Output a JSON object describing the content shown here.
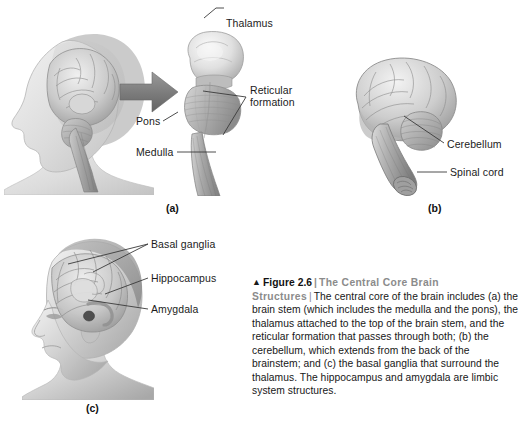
{
  "figure": {
    "panels": [
      {
        "id": "a",
        "letter": "(a)",
        "name": "head-with-brainstem-panel",
        "labels": [
          {
            "name": "thalamus",
            "text": "Thalamus"
          },
          {
            "name": "reticular-formation",
            "text": "Reticular\nformation"
          },
          {
            "name": "pons",
            "text": "Pons"
          },
          {
            "name": "medulla",
            "text": "Medulla"
          }
        ]
      },
      {
        "id": "b",
        "letter": "(b)",
        "name": "brain-with-cerebellum-panel",
        "labels": [
          {
            "name": "cerebellum",
            "text": "Cerebellum"
          },
          {
            "name": "spinal-cord",
            "text": "Spinal cord"
          }
        ]
      },
      {
        "id": "c",
        "letter": "(c)",
        "name": "head-with-limbic-structures-panel",
        "labels": [
          {
            "name": "basal-ganglia",
            "text": "Basal ganglia"
          },
          {
            "name": "hippocampus",
            "text": "Hippocampus"
          },
          {
            "name": "amygdala",
            "text": "Amygdala"
          }
        ]
      }
    ],
    "caption": {
      "marker": "▲",
      "figure_number": "Figure 2.6",
      "separator": "|",
      "title": "The Central Core Brain Structures",
      "separator2": "|",
      "body": "The central core of the brain includes (a) the brain stem (which includes the medulla and the pons), the thalamus attached to the top of the brain stem, and the reticular formation that passes through both; (b) the cerebellum, which extends from the back of the brainstem; and (c) the basal ganglia that surround the thalamus. The hippocampus and amygdala are limbic system structures."
    },
    "colors": {
      "background": "#ffffff",
      "label_text": "#1b1b1b",
      "leader_line": "#3a3a3a",
      "caption_title": "#8b8b8b",
      "caption_number": "#111111",
      "arrow": "#7d7d7d",
      "illustration_light": "#e3e3e3",
      "illustration_mid": "#b9b9b9",
      "illustration_dark": "#8a8a8a"
    }
  }
}
